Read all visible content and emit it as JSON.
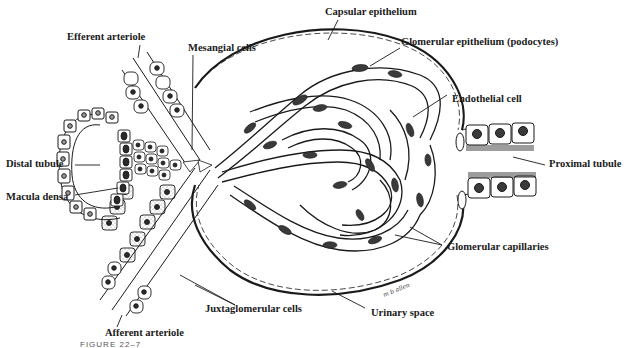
{
  "figure": {
    "caption_partial": "FIGURE 22–7",
    "artist_signature": "m b allen"
  },
  "labels": [
    {
      "id": "capsular-epithelium",
      "text": "Capsular epithelium"
    },
    {
      "id": "efferent-arteriole",
      "text": "Efferent arteriole"
    },
    {
      "id": "mesangial-cells",
      "text": "Mesangial cells"
    },
    {
      "id": "glomerular-epithelium",
      "text": "Glomerular epithelium (podocytes)"
    },
    {
      "id": "endothelial-cell",
      "text": "Endothelial cell"
    },
    {
      "id": "distal-tubule",
      "text": "Distal tubule"
    },
    {
      "id": "macula-densa",
      "text": "Macula densa"
    },
    {
      "id": "proximal-tubule",
      "text": "Proximal tubule"
    },
    {
      "id": "glomerular-capillaries",
      "text": "Glomerular capillaries"
    },
    {
      "id": "juxtaglomerular-cells",
      "text": "Juxtaglomerular cells"
    },
    {
      "id": "urinary-space",
      "text": "Urinary space"
    },
    {
      "id": "afferent-arteriole",
      "text": "Afferent arteriole"
    }
  ],
  "colors": {
    "ink": "#1a1a1a",
    "background": "#ffffff",
    "nucleus_fill": "#3a3a3a",
    "granule_fill": "#9a9a9a"
  }
}
